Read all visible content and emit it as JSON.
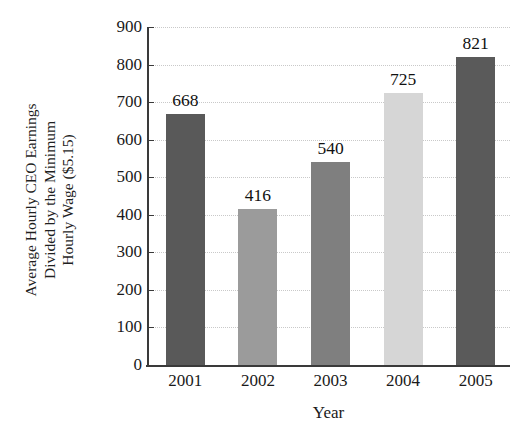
{
  "chart_data": {
    "type": "bar",
    "title": "",
    "categories": [
      "2001",
      "2002",
      "2003",
      "2004",
      "2005"
    ],
    "values": [
      668,
      416,
      540,
      725,
      821
    ],
    "value_labels": [
      "668",
      "416",
      "540",
      "725",
      "821"
    ],
    "xlabel": "Year",
    "ylabel": "Average Hourly CEO Earnings Divided by the Minimum Hourly Wage ($5.15)",
    "ylabel_lines": [
      "Average Hourly CEO Earnings",
      "Divided by the Minimum",
      "Hourly Wage ($5.15)"
    ],
    "ylim": [
      0,
      900
    ],
    "ytick_labels": [
      "0",
      "100",
      "200",
      "300",
      "400",
      "500",
      "600",
      "700",
      "800",
      "900"
    ],
    "ytick_values": [
      0,
      100,
      200,
      300,
      400,
      500,
      600,
      700,
      800,
      900
    ],
    "grid": true,
    "grid_axis": "y",
    "grid_style": "dotted",
    "legend": "none",
    "bar_colors": [
      "#595959",
      "#9b9b9b",
      "#7f7f7f",
      "#d6d6d6",
      "#5a5a5a"
    ],
    "axis_color": "#3a3a3a",
    "grid_color": "#c9c9c9"
  },
  "clipped_header": {
    "text": ""
  }
}
